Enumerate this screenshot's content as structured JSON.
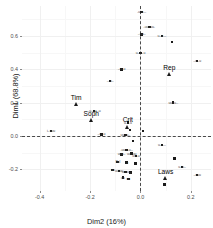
{
  "chart_data": {
    "type": "scatter",
    "title": "",
    "xlabel": "Dim2 (16%)",
    "ylabel": "Dim1 (68.8%)",
    "xlim": [
      -0.47,
      0.28
    ],
    "ylim": [
      -0.33,
      0.78
    ],
    "xticks": [
      -0.4,
      -0.2,
      0.0,
      0.2
    ],
    "xticklabels": [
      "-0.4",
      "-0.2",
      "0.0",
      "0.2"
    ],
    "yticks": [
      -0.2,
      0.0,
      0.2,
      0.4,
      0.6
    ],
    "yticklabels": [
      "-0.2",
      "0.0",
      "0.2",
      "0.4",
      "0.6"
    ],
    "grid": true,
    "legend": "none",
    "reference_lines": [
      {
        "axis": "vertical",
        "value": 0.0,
        "style": "dashed"
      },
      {
        "axis": "horizontal",
        "value": 0.0,
        "style": "dashed"
      }
    ],
    "series": [
      {
        "name": "categories",
        "marker": "square",
        "points": [
          {
            "x": 0.005,
            "y": 0.745,
            "label": "-u-u---"
          },
          {
            "x": 0.035,
            "y": 0.655,
            "label": "-uu--uu-"
          },
          {
            "x": 0.005,
            "y": 0.61,
            "label": "--uu--"
          },
          {
            "x": 0.085,
            "y": 0.6,
            "label": "u--u---"
          },
          {
            "x": 0.125,
            "y": 0.565,
            "label": ""
          },
          {
            "x": 0.0,
            "y": 0.497,
            "label": "u--u--u"
          },
          {
            "x": 0.225,
            "y": 0.45,
            "label": "--u--u"
          },
          {
            "x": -0.075,
            "y": 0.4,
            "label": "--u--u"
          },
          {
            "x": -0.12,
            "y": 0.33,
            "label": "---u--"
          },
          {
            "x": 0.13,
            "y": 0.2,
            "label": "uu--u--"
          },
          {
            "x": -0.185,
            "y": 0.15,
            "label": "--u--uu--u"
          },
          {
            "x": -0.05,
            "y": 0.08,
            "label": "u----u"
          },
          {
            "x": -0.355,
            "y": 0.03,
            "label": "i--uuu"
          },
          {
            "x": -0.155,
            "y": 0.01,
            "label": "--u--u"
          },
          {
            "x": -0.042,
            "y": 0.035,
            "label": ""
          },
          {
            "x": 0.01,
            "y": 0.03,
            "label": ""
          },
          {
            "x": -0.06,
            "y": 0.005,
            "label": "uu--u--"
          },
          {
            "x": -0.03,
            "y": -0.03,
            "label": ""
          },
          {
            "x": 0.085,
            "y": -0.055,
            "label": "u------"
          },
          {
            "x": -0.055,
            "y": -0.085,
            "label": "-uuu--u--"
          },
          {
            "x": -0.035,
            "y": -0.105,
            "label": "uu--uu"
          },
          {
            "x": -0.075,
            "y": -0.11,
            "label": "uuu--"
          },
          {
            "x": -0.018,
            "y": -0.12,
            "label": "uu--u"
          },
          {
            "x": 0.135,
            "y": -0.135,
            "label": ""
          },
          {
            "x": -0.09,
            "y": -0.155,
            "label": "Pol"
          },
          {
            "x": -0.055,
            "y": -0.16,
            "label": "-u"
          },
          {
            "x": -0.02,
            "y": -0.165,
            "label": ""
          },
          {
            "x": 0.165,
            "y": -0.185,
            "label": "u--u--"
          },
          {
            "x": -0.11,
            "y": -0.205,
            "label": "uu"
          },
          {
            "x": -0.085,
            "y": -0.21,
            "label": "uu-uu"
          },
          {
            "x": -0.06,
            "y": -0.215,
            "label": "uuuu"
          },
          {
            "x": -0.04,
            "y": -0.22,
            "label": "u"
          },
          {
            "x": 0.225,
            "y": -0.235,
            "label": "--uuu"
          },
          {
            "x": -0.07,
            "y": -0.25,
            "label": "uu"
          },
          {
            "x": -0.048,
            "y": -0.258,
            "label": "uu"
          },
          {
            "x": 0.095,
            "y": -0.29,
            "label": ""
          }
        ]
      },
      {
        "name": "individuals",
        "marker": "triangle",
        "points": [
          {
            "x": -0.255,
            "y": 0.19,
            "label": "Tim"
          },
          {
            "x": -0.195,
            "y": 0.095,
            "label": "Soph"
          },
          {
            "x": -0.05,
            "y": 0.055,
            "label": "Crit"
          },
          {
            "x": 0.115,
            "y": 0.37,
            "label": "Rep"
          },
          {
            "x": 0.1,
            "y": -0.255,
            "label": "Laws"
          }
        ]
      }
    ]
  }
}
